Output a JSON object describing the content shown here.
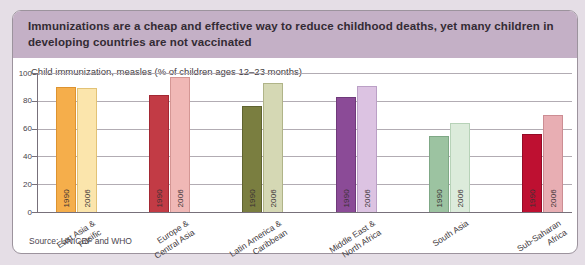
{
  "header": {
    "title": "Immunizations are a cheap and effective way to reduce childhood deaths, yet many children in developing countries are not vaccinated"
  },
  "source_note": "Source: UNICEF and WHO",
  "colors": {
    "page_background": "#e5dee6",
    "card_background": "#ffffff",
    "card_border": "#9c939d",
    "header_band": "#c4b0c6",
    "axis_line": "#77707a",
    "gridline": "#b2acb3"
  },
  "chart_data": {
    "type": "bar",
    "title": "Child immunization, measles (% of children ages 12–23 months)",
    "xlabel": "",
    "ylabel": "",
    "ylim": [
      0,
      100
    ],
    "yticks": [
      0,
      20,
      40,
      60,
      80,
      100
    ],
    "grid": "horizontal",
    "legend_position": "none (years labeled vertically inside bars)",
    "categories": [
      "East Asia &\nPacific",
      "Europe &\nCentral Asia",
      "Latin America &\nCaribbean",
      "Middle East &\nNorth Africa",
      "South Asia",
      "Sub-Saharan\nAfrica"
    ],
    "series": [
      {
        "name": "1990",
        "values": [
          90,
          84,
          76,
          83,
          55,
          56
        ],
        "fills": [
          "#F5AE4B",
          "#C23B45",
          "#7A7E40",
          "#8B4B97",
          "#9CC3A1",
          "#BE1031"
        ],
        "borders": [
          "#DD9330",
          "#A32833",
          "#5F6330",
          "#6F3A7A",
          "#7FA886",
          "#950B26"
        ]
      },
      {
        "name": "2006",
        "values": [
          89,
          97,
          93,
          91,
          64,
          70
        ],
        "fills": [
          "#FBE5AC",
          "#F0B8B6",
          "#D5D8B4",
          "#DCC3E2",
          "#DCEBDB",
          "#E8AEB3"
        ],
        "borders": [
          "#E2C276",
          "#D49694",
          "#B0B488",
          "#BBA0C6",
          "#B7D2B8",
          "#CC8D93"
        ]
      }
    ]
  }
}
